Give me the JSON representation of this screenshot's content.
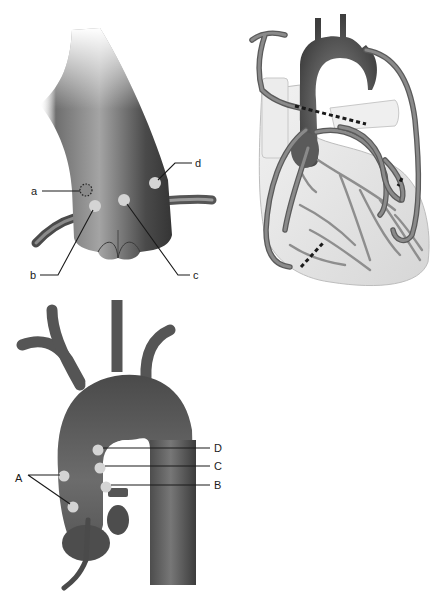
{
  "figure": {
    "panels": [
      {
        "id": "aortic-root",
        "description": "Aortic root with cannulation/anastomosis sites",
        "labels": [
          {
            "text": "a",
            "x": 35,
            "y": 191
          },
          {
            "text": "b",
            "x": 33,
            "y": 275
          },
          {
            "text": "c",
            "x": 196,
            "y": 275
          },
          {
            "text": "d",
            "x": 197,
            "y": 163
          }
        ]
      },
      {
        "id": "heart-grafts",
        "description": "Heart with coronary artery bypass grafts"
      },
      {
        "id": "aortic-arch",
        "description": "Aortic arch with labeled sites",
        "labels": [
          {
            "text": "A",
            "x": 18,
            "y": 482
          },
          {
            "text": "B",
            "x": 217,
            "y": 489
          },
          {
            "text": "C",
            "x": 217,
            "y": 469
          },
          {
            "text": "D",
            "x": 217,
            "y": 449
          }
        ]
      }
    ]
  },
  "colors": {
    "vessel_dark": "#3f3f3f",
    "vessel_mid": "#6a6a6a",
    "vessel_light": "#b0b0b0",
    "site_marker": "#d4d4d4",
    "heart_fill": "#e6e6e6",
    "line": "#1a1a1a"
  }
}
